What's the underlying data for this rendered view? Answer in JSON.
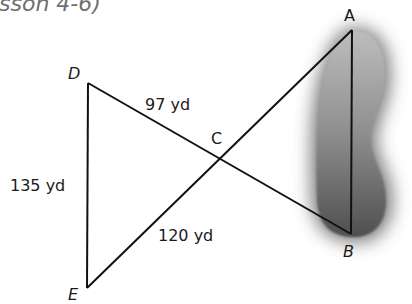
{
  "header": {
    "title_fragment": "sson 4-6)"
  },
  "points": {
    "A": {
      "label": "A",
      "x": 352,
      "y": 30
    },
    "B": {
      "label": "B",
      "x": 351,
      "y": 234
    },
    "C": {
      "label": "C",
      "x": 219,
      "y": 159
    },
    "D": {
      "label": "D",
      "x": 88,
      "y": 83
    },
    "E": {
      "label": "E",
      "x": 87,
      "y": 288
    }
  },
  "segments": [
    {
      "from": "D",
      "to": "B"
    },
    {
      "from": "E",
      "to": "A"
    },
    {
      "from": "D",
      "to": "E"
    },
    {
      "from": "A",
      "to": "B"
    }
  ],
  "measurements": {
    "DC": "97 yd",
    "DE": "135 yd",
    "EC": "120 yd"
  },
  "colors": {
    "line": "#111111",
    "pond_light": "#b5b5b5",
    "pond_dark": "#5a5a5a",
    "title": "#6e6e6e"
  }
}
